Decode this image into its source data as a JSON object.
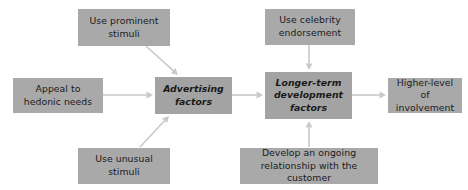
{
  "diagram": {
    "colors": {
      "box_fill": "#a9a9a9",
      "box_fill_emphasis": "#a3a3a3",
      "arrow": "#c9c9c9",
      "text": "#1a1a1a",
      "background": "#ffffff"
    },
    "nodes": [
      {
        "id": "use-prominent-stimuli",
        "label": "Use prominent\nstimuli",
        "emphasis": false,
        "x": 78,
        "y": 9,
        "w": 92,
        "h": 37
      },
      {
        "id": "use-celebrity-endorsement",
        "label": "Use celebrity\nendorsement",
        "emphasis": false,
        "x": 265,
        "y": 9,
        "w": 90,
        "h": 36
      },
      {
        "id": "appeal-to-hedonic-needs",
        "label": "Appeal to\nhedonic needs",
        "emphasis": false,
        "x": 13,
        "y": 78,
        "w": 90,
        "h": 35
      },
      {
        "id": "advertising-factors",
        "label": "Advertising\nfactors",
        "emphasis": true,
        "x": 155,
        "y": 77,
        "w": 77,
        "h": 37
      },
      {
        "id": "longer-term-development-factors",
        "label": "Longer-term\ndevelopment\nfactors",
        "emphasis": true,
        "x": 265,
        "y": 72,
        "w": 87,
        "h": 47
      },
      {
        "id": "higher-level-of-involvement",
        "label": "Higher-level\nof involvement",
        "emphasis": false,
        "x": 388,
        "y": 78,
        "w": 74,
        "h": 35
      },
      {
        "id": "use-unusual-stimuli",
        "label": "Use unusual\nstimuli",
        "emphasis": false,
        "x": 78,
        "y": 148,
        "w": 92,
        "h": 36
      },
      {
        "id": "develop-ongoing-relationship",
        "label": "Develop an ongoing\nrelationship with the customer",
        "emphasis": false,
        "x": 240,
        "y": 148,
        "w": 138,
        "h": 36
      }
    ],
    "edges": [
      {
        "id": "edge-prominent-to-advertising",
        "from": "use-prominent-stimuli",
        "to": "advertising-factors",
        "x1": 146,
        "y1": 46,
        "x2": 178,
        "y2": 75
      },
      {
        "id": "edge-celebrity-to-longer-term",
        "from": "use-celebrity-endorsement",
        "to": "longer-term-development-factors",
        "x1": 309,
        "y1": 45,
        "x2": 309,
        "y2": 70
      },
      {
        "id": "edge-hedonic-to-advertising",
        "from": "appeal-to-hedonic-needs",
        "to": "advertising-factors",
        "x1": 103,
        "y1": 95,
        "x2": 153,
        "y2": 95
      },
      {
        "id": "edge-advertising-to-longer-term",
        "from": "advertising-factors",
        "to": "longer-term-development-factors",
        "x1": 232,
        "y1": 95,
        "x2": 263,
        "y2": 95
      },
      {
        "id": "edge-longer-term-to-higher-level",
        "from": "longer-term-development-factors",
        "to": "higher-level-of-involvement",
        "x1": 352,
        "y1": 95,
        "x2": 386,
        "y2": 95
      },
      {
        "id": "edge-unusual-to-advertising",
        "from": "use-unusual-stimuli",
        "to": "advertising-factors",
        "x1": 140,
        "y1": 147,
        "x2": 169,
        "y2": 116
      },
      {
        "id": "edge-relationship-to-longer-term",
        "from": "develop-ongoing-relationship",
        "to": "longer-term-development-factors",
        "x1": 309,
        "y1": 147,
        "x2": 309,
        "y2": 121
      }
    ]
  }
}
